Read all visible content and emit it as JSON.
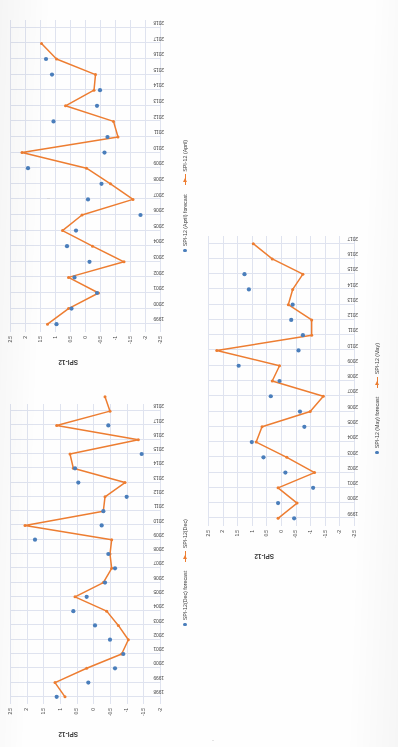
{
  "page": {
    "background_color": "#ffffff",
    "line_color": "#ed7d31",
    "marker_color": "#4a7ebb",
    "grid_color": "#dfe3ef",
    "orientation_note": "charts rotated 90 degrees counter-clockwise on the scanned page"
  },
  "charts": [
    {
      "id": "april",
      "chart_data": {
        "type": "line",
        "title": "",
        "xlabel": "",
        "ylabel": "SPI-12",
        "ylim": [
          -2.5,
          2.5
        ],
        "yticks": [
          "2.5",
          "2",
          "1.5",
          "1",
          "0.5",
          "0",
          "-0.5",
          "-1",
          "-1.5",
          "-2",
          "-2.5"
        ],
        "grid": true,
        "legend_position": "bottom",
        "categories": [
          "1999",
          "2000",
          "2001",
          "2002",
          "2003",
          "2004",
          "2005",
          "2006",
          "2007",
          "2008",
          "2009",
          "2010",
          "2011",
          "2012",
          "2013",
          "2014",
          "2015",
          "2016",
          "2017",
          "2018"
        ],
        "series": [
          {
            "name": "SPI-12 (April)",
            "type": "line",
            "color": "#ed7d31",
            "values": [
              1.25,
              0.55,
              -0.45,
              0.55,
              -1.3,
              -0.25,
              0.75,
              0.1,
              -1.6,
              -0.85,
              -0.05,
              2.1,
              -1.1,
              -0.95,
              0.65,
              -0.3,
              -0.35,
              0.95,
              1.45
            ]
          },
          {
            "name": "SPI-12 (April) forecast",
            "type": "scatter",
            "color": "#4a7ebb",
            "values": [
              0.95,
              0.45,
              -0.4,
              0.35,
              -0.15,
              0.6,
              0.3,
              -1.85,
              -0.1,
              -0.55,
              1.9,
              -0.65,
              -0.75,
              1.05,
              -0.4,
              -0.5,
              1.1,
              1.3,
              null
            ]
          }
        ]
      }
    },
    {
      "id": "december",
      "chart_data": {
        "type": "line",
        "title": "",
        "xlabel": "",
        "ylabel": "SPI-12",
        "ylim": [
          -2,
          2.5
        ],
        "yticks": [
          "2.5",
          "2",
          "1.5",
          "1",
          "0.5",
          "0",
          "-0.5",
          "-1",
          "-1.5",
          "-2"
        ],
        "grid": true,
        "legend_position": "bottom",
        "categories": [
          "1998",
          "1999",
          "2000",
          "2001",
          "2002",
          "2003",
          "2004",
          "2005",
          "2006",
          "2007",
          "2008",
          "2009",
          "2010",
          "2011",
          "2012",
          "2013",
          "2014",
          "2015",
          "2016",
          "2017",
          "2018"
        ],
        "series": [
          {
            "name": "SPI-12(Dec)",
            "type": "line",
            "color": "#ed7d31",
            "values": [
              0.85,
              1.15,
              0.2,
              -0.85,
              -1.05,
              -0.75,
              -0.4,
              0.55,
              -0.3,
              -0.55,
              -0.5,
              -0.55,
              2.05,
              -0.3,
              -0.35,
              -0.95,
              0.6,
              0.7,
              -1.35,
              1.1,
              -0.5,
              -0.35
            ]
          },
          {
            "name": "SPI-12(Dec) forecast",
            "type": "scatter",
            "color": "#4a7ebb",
            "values": [
              1.1,
              0.15,
              -0.65,
              -0.9,
              -0.5,
              -0.05,
              0.6,
              0.2,
              -0.35,
              -0.65,
              -0.45,
              1.75,
              -0.25,
              -0.3,
              -1.0,
              0.45,
              0.55,
              -1.45,
              null,
              -0.45,
              null
            ]
          }
        ]
      }
    },
    {
      "id": "may",
      "chart_data": {
        "type": "line",
        "title": "",
        "xlabel": "",
        "ylabel": "SPI-12",
        "ylim": [
          -2.5,
          2.5
        ],
        "yticks": [
          "2.5",
          "2",
          "1.5",
          "1",
          "0.5",
          "0",
          "-0.5",
          "-1",
          "-1.5",
          "-2",
          "-2.5"
        ],
        "grid": true,
        "legend_position": "bottom",
        "categories": [
          "1999",
          "2000",
          "2001",
          "2002",
          "2003",
          "2004",
          "2005",
          "2006",
          "2007",
          "2008",
          "2009",
          "2010",
          "2011",
          "2012",
          "2013",
          "2014",
          "2015",
          "2016",
          "2017"
        ],
        "series": [
          {
            "name": "SPI-12 (May)",
            "type": "line",
            "color": "#ed7d31",
            "values": [
              0.1,
              -0.55,
              0.1,
              -1.15,
              -0.2,
              0.85,
              0.65,
              -1.0,
              -1.45,
              0.3,
              0.05,
              2.2,
              -1.05,
              -1.05,
              -0.25,
              -0.4,
              -0.75,
              0.3,
              0.95
            ]
          },
          {
            "name": "SPI-12 (May) forecast",
            "type": "scatter",
            "color": "#4a7ebb",
            "values": [
              -0.45,
              0.1,
              -1.1,
              -0.15,
              0.6,
              1.0,
              -0.8,
              -0.65,
              0.35,
              0.05,
              1.45,
              -0.6,
              -0.75,
              -0.35,
              -0.4,
              1.1,
              1.25,
              null,
              null
            ]
          }
        ]
      }
    }
  ]
}
